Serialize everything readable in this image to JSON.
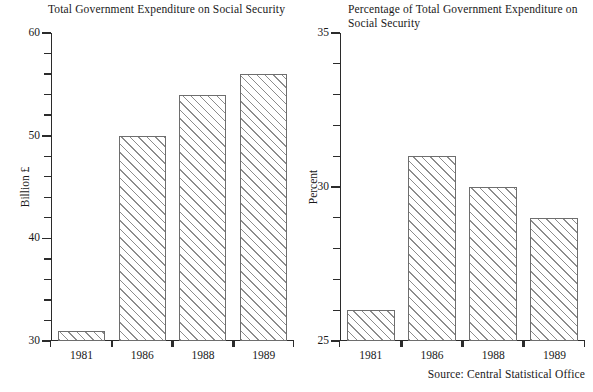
{
  "source_note": "Source: Central Statistical Office",
  "chart_data": [
    {
      "type": "bar",
      "id": "left",
      "title": "Total Government Expenditure on Social Security",
      "xlabel": "",
      "ylabel": "Billion £",
      "categories": [
        "1981",
        "1986",
        "1988",
        "1989"
      ],
      "values": [
        31,
        50,
        54,
        56
      ],
      "ylim": [
        30,
        60
      ],
      "ytick_labels": [
        "30",
        "40",
        "50",
        "60"
      ],
      "ytick_values": [
        30,
        40,
        50,
        60
      ],
      "yminor_step": 2,
      "grid": false,
      "legend": null
    },
    {
      "type": "bar",
      "id": "right",
      "title": "Percentage of Total Government Expenditure on Social Security",
      "xlabel": "",
      "ylabel": "Percent",
      "categories": [
        "1981",
        "1986",
        "1988",
        "1989"
      ],
      "values": [
        26,
        31,
        30,
        29
      ],
      "ylim": [
        25,
        35
      ],
      "ytick_labels": [
        "25",
        "30",
        "35"
      ],
      "ytick_values": [
        25,
        30,
        35
      ],
      "yminor_step": 1,
      "grid": false,
      "legend": null
    }
  ]
}
